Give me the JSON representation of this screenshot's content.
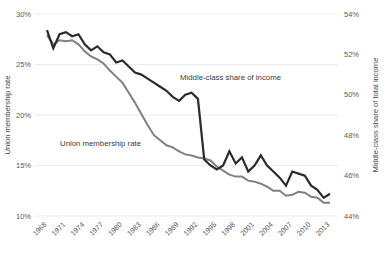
{
  "chart_data": {
    "type": "line",
    "title": "",
    "xlabel": "",
    "grid": "horizontal",
    "legend_position": "inline-annotations",
    "x": [
      1968,
      1969,
      1970,
      1971,
      1972,
      1973,
      1974,
      1975,
      1976,
      1977,
      1978,
      1979,
      1980,
      1981,
      1982,
      1983,
      1984,
      1985,
      1986,
      1987,
      1988,
      1989,
      1990,
      1991,
      1992,
      1993,
      1994,
      1995,
      1996,
      1997,
      1998,
      1999,
      2000,
      2001,
      2002,
      2003,
      2004,
      2005,
      2006,
      2007,
      2008,
      2009,
      2010,
      2011,
      2012,
      2013
    ],
    "x_tick_labels": [
      "1968",
      "1971",
      "1974",
      "1977",
      "1980",
      "1983",
      "1986",
      "1989",
      "1992",
      "1995",
      "1998",
      "2001",
      "2004",
      "2007",
      "2010",
      "2013"
    ],
    "axes": [
      {
        "id": "left",
        "label": "Union membership rate",
        "ticks": [
          "30%",
          "25%",
          "20%",
          "15%",
          "10%"
        ],
        "tick_values": [
          30,
          25,
          20,
          15,
          10
        ],
        "ylim": [
          10,
          30
        ]
      },
      {
        "id": "right",
        "label": "Middle-class share of total income",
        "ticks": [
          "54%",
          "52%",
          "50%",
          "48%",
          "46%",
          "44%"
        ],
        "tick_values": [
          54,
          52,
          50,
          48,
          46,
          44
        ],
        "ylim": [
          44,
          54
        ]
      }
    ],
    "series": [
      {
        "name": "Union membership rate",
        "annotation": "Union membership rate",
        "axis": "left",
        "color": "#808080",
        "stroke_width": 2.0,
        "annotation_x": 60,
        "annotation_y": 146,
        "values": [
          27.9,
          27.0,
          27.4,
          27.3,
          27.4,
          27.0,
          26.3,
          25.8,
          25.5,
          25.1,
          24.4,
          23.8,
          23.2,
          22.2,
          21.2,
          20.1,
          19.0,
          18.0,
          17.5,
          17.0,
          16.8,
          16.4,
          16.1,
          16.0,
          15.8,
          15.7,
          15.5,
          14.9,
          14.5,
          14.1,
          13.9,
          13.9,
          13.5,
          13.4,
          13.2,
          12.9,
          12.5,
          12.5,
          12.0,
          12.1,
          12.4,
          12.3,
          11.9,
          11.8,
          11.3,
          11.3
        ]
      },
      {
        "name": "Middle-class share of income",
        "annotation": "Middle-class share of income",
        "axis": "right",
        "color": "#2b2b2b",
        "stroke_width": 2.2,
        "annotation_x": 180,
        "annotation_y": 80,
        "values": [
          53.2,
          52.3,
          53.0,
          53.1,
          52.9,
          53.0,
          52.5,
          52.2,
          52.4,
          52.1,
          52.0,
          51.6,
          51.7,
          51.4,
          51.1,
          51.0,
          50.8,
          50.6,
          50.4,
          50.2,
          49.9,
          49.7,
          50.0,
          50.1,
          49.8,
          46.8,
          46.5,
          46.3,
          46.5,
          47.2,
          46.6,
          46.9,
          46.2,
          46.5,
          47.0,
          46.5,
          46.2,
          45.9,
          45.5,
          46.2,
          46.1,
          46.0,
          45.5,
          45.3,
          44.9,
          45.1
        ]
      }
    ]
  },
  "plot": {
    "left": 47,
    "right": 330,
    "top": 14,
    "bottom": 216
  }
}
